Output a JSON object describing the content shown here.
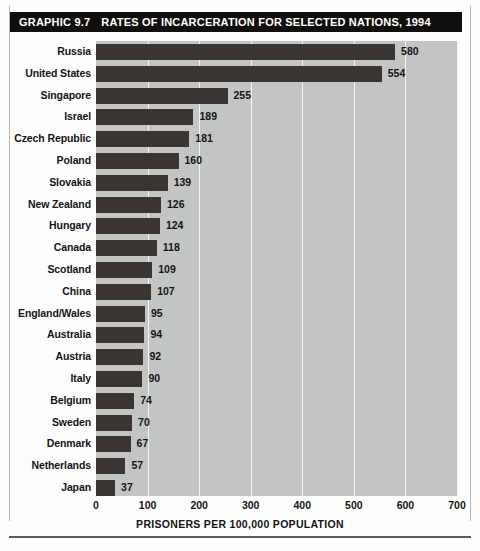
{
  "figure": {
    "graphic_number": "GRAPHIC 9.7",
    "title": "RATES OF INCARCERATION FOR SELECTED NATIONS, 1994"
  },
  "colors": {
    "banner_background": "#100f0d",
    "banner_text": "#ffffff",
    "bar": "#3a3532",
    "plot_background": "#c3c5c4",
    "gridline": "#f2f3f2",
    "text": "#141414"
  },
  "chart_data": {
    "type": "bar",
    "orientation": "horizontal",
    "title": "RATES OF INCARCERATION FOR SELECTED NATIONS, 1994",
    "xlabel": "PRISONERS PER 100,000 POPULATION",
    "ylabel": "",
    "xlim": [
      0,
      700
    ],
    "xticks": [
      0,
      100,
      200,
      300,
      400,
      500,
      600,
      700
    ],
    "xtick_labels": [
      "0",
      "100",
      "200",
      "300",
      "400",
      "500",
      "600",
      "700"
    ],
    "grid": true,
    "grid_axis": "x",
    "legend": false,
    "data_labels": true,
    "categories": [
      "Russia",
      "United States",
      "Singapore",
      "Israel",
      "Czech Republic",
      "Poland",
      "Slovakia",
      "New Zealand",
      "Hungary",
      "Canada",
      "Scotland",
      "China",
      "England/Wales",
      "Australia",
      "Austria",
      "Italy",
      "Belgium",
      "Sweden",
      "Denmark",
      "Netherlands",
      "Japan"
    ],
    "values": [
      580,
      554,
      255,
      189,
      181,
      160,
      139,
      126,
      124,
      118,
      109,
      107,
      95,
      94,
      92,
      90,
      74,
      70,
      67,
      57,
      37
    ]
  }
}
